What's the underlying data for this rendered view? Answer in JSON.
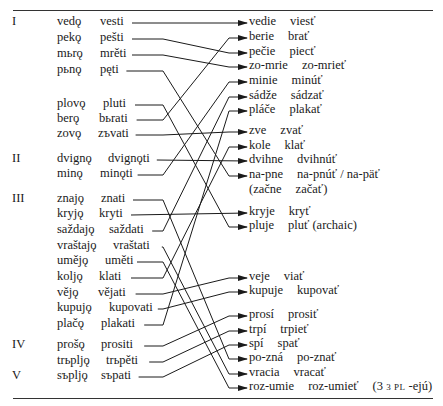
{
  "diagram": {
    "classes": [
      {
        "label": "I",
        "y": 22
      },
      {
        "label": "II",
        "y": 159
      },
      {
        "label": "III",
        "y": 199
      },
      {
        "label": "IV",
        "y": 345
      },
      {
        "label": "V",
        "y": 376
      }
    ],
    "left": [
      {
        "pres": "vedǫ",
        "inf": "vesti",
        "y": 22,
        "ix": 100,
        "end": 163
      },
      {
        "pres": "pekǫ",
        "inf": "pešti",
        "y": 38,
        "ix": 100,
        "end": 163
      },
      {
        "pres": "mьrǫ",
        "inf": "mrěti",
        "y": 54,
        "ix": 100,
        "end": 163
      },
      {
        "pres": "pьnǫ",
        "inf": "pęti",
        "y": 70,
        "ix": 100,
        "end": 163
      },
      {
        "pres": "plovǫ",
        "inf": "pluti",
        "y": 104,
        "ix": 103,
        "end": 163
      },
      {
        "pres": "berǫ",
        "inf": "bьrati",
        "y": 119,
        "ix": 99,
        "end": 163
      },
      {
        "pres": "zovǫ",
        "inf": "zъvati",
        "y": 134,
        "ix": 98,
        "end": 163
      },
      {
        "pres": "dvignǫ",
        "inf": "dvignǫti",
        "y": 159,
        "ix": 108,
        "end": 163
      },
      {
        "pres": "minǫ",
        "inf": "minǫti",
        "y": 174,
        "ix": 100,
        "end": 163
      },
      {
        "pres": "znajǫ",
        "inf": "znati",
        "y": 199,
        "ix": 101,
        "end": 163
      },
      {
        "pres": "kryjǫ",
        "inf": "kryti",
        "y": 214,
        "ix": 99,
        "end": 163
      },
      {
        "pres": "saždajǫ",
        "inf": "saždati",
        "y": 230,
        "ix": 109,
        "end": 163
      },
      {
        "pres": "vraštajǫ",
        "inf": "vraštati",
        "y": 246,
        "ix": 113,
        "end": 163
      },
      {
        "pres": "uměјǫ",
        "inf": "uměti",
        "y": 261,
        "ix": 105,
        "end": 163
      },
      {
        "pres": "koljǫ",
        "inf": "klati",
        "y": 277,
        "ix": 99,
        "end": 163
      },
      {
        "pres": "věјǫ",
        "inf": "vějati",
        "y": 293,
        "ix": 98,
        "end": 163
      },
      {
        "pres": "kupujǫ",
        "inf": "kupovati",
        "y": 308,
        "ix": 109,
        "end": 163
      },
      {
        "pres": "plačǫ",
        "inf": "plakati",
        "y": 324,
        "ix": 101,
        "end": 163
      },
      {
        "pres": "prošǫ",
        "inf": "prositi",
        "y": 345,
        "ix": 101,
        "end": 163
      },
      {
        "pres": "trьpljǫ",
        "inf": "trьpěti",
        "y": 361,
        "ix": 106,
        "end": 163
      },
      {
        "pres": "sъpljǫ",
        "inf": "sъpati",
        "y": 376,
        "ix": 101,
        "end": 163
      }
    ],
    "right": [
      {
        "pres": "vedie",
        "inf": "viesť",
        "y": 22
      },
      {
        "pres": "berie",
        "inf": "brať",
        "y": 37
      },
      {
        "pres": "pečie",
        "inf": "piecť",
        "y": 52
      },
      {
        "pres": "zo-mrie",
        "inf": "zo-mrieť",
        "y": 66
      },
      {
        "pres": "minie",
        "inf": "minúť",
        "y": 81
      },
      {
        "pres": "sádže",
        "inf": "sádzať",
        "y": 96
      },
      {
        "pres": "pláče",
        "inf": "plakať",
        "y": 110
      },
      {
        "pres": "zve",
        "inf": "zvať",
        "y": 131
      },
      {
        "pres": "kole",
        "inf": "klať",
        "y": 146
      },
      {
        "pres": "dvihne",
        "inf": "dvihnúť",
        "y": 160
      },
      {
        "pres": "na-pne",
        "inf": "na-pnúť / na-päť",
        "y": 175
      },
      {
        "pres": "(začne",
        "inf": "začať)",
        "y": 190,
        "noarrow": true
      },
      {
        "pres": "kryje",
        "inf": "kryť",
        "y": 212
      },
      {
        "pres": "pluje",
        "inf": "pluť (archaic)",
        "y": 226
      },
      {
        "pres": "veje",
        "inf": "viať",
        "y": 277
      },
      {
        "pres": "kupuje",
        "inf": "kupovať",
        "y": 291
      },
      {
        "pres": "prosí",
        "inf": "prosiť",
        "y": 315
      },
      {
        "pres": "trpí",
        "inf": "trpieť",
        "y": 330
      },
      {
        "pres": "spí",
        "inf": "spať",
        "y": 344
      },
      {
        "pres": "po-zná",
        "inf": "po-znať",
        "y": 358
      },
      {
        "pres": "vracia",
        "inf": "vracať",
        "y": 373
      },
      {
        "pres": "roz-umie",
        "inf": "roz-umieť",
        "note_sc": "3 pl",
        "note": "-ejú",
        "y": 387
      }
    ],
    "links": [
      [
        0,
        0
      ],
      [
        1,
        2
      ],
      [
        2,
        3
      ],
      [
        3,
        10
      ],
      [
        4,
        13
      ],
      [
        5,
        1
      ],
      [
        6,
        7
      ],
      [
        7,
        9
      ],
      [
        8,
        4
      ],
      [
        9,
        19
      ],
      [
        10,
        12
      ],
      [
        11,
        5
      ],
      [
        12,
        20
      ],
      [
        13,
        21
      ],
      [
        14,
        8
      ],
      [
        15,
        14
      ],
      [
        16,
        15
      ],
      [
        17,
        6
      ],
      [
        18,
        16
      ],
      [
        19,
        17
      ],
      [
        20,
        18
      ]
    ],
    "colors": {
      "ink": "#1a1a1a",
      "rule": "#333333"
    }
  }
}
